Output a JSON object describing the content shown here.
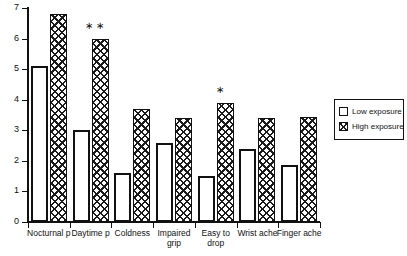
{
  "chart_data": {
    "type": "bar",
    "title": "",
    "xlabel": "",
    "ylabel": "",
    "ylim": [
      0,
      7
    ],
    "yticks": [
      0,
      1,
      2,
      3,
      4,
      5,
      6,
      7
    ],
    "grid": false,
    "legend_position": "right",
    "categories": [
      "Nocturnal p",
      "Daytime p",
      "Coldness",
      "Impaired grip",
      "Easy to drop",
      "Wrist ache",
      "Finger ache"
    ],
    "category_lines": [
      [
        "Nocturnal p"
      ],
      [
        "Daytime p"
      ],
      [
        "Coldness"
      ],
      [
        "Impaired",
        "grip"
      ],
      [
        "Easy to",
        "drop"
      ],
      [
        "Wrist ache"
      ],
      [
        "Finger ache"
      ]
    ],
    "series": [
      {
        "name": "Low exposure",
        "values": [
          5.1,
          3.0,
          1.6,
          2.6,
          1.5,
          2.4,
          1.85
        ]
      },
      {
        "name": "High exposure",
        "values": [
          6.8,
          6.0,
          3.7,
          3.4,
          3.9,
          3.4,
          3.45
        ]
      }
    ],
    "annotations": [
      {
        "category": "Daytime p",
        "marker": "∗ ∗",
        "meaning": "significance-asterisks"
      },
      {
        "category": "Easy to drop",
        "marker": "∗",
        "meaning": "significance-asterisk"
      }
    ]
  },
  "legend": {
    "items": [
      {
        "label": "Low exposure",
        "pattern": "open-white"
      },
      {
        "label": "High exposure",
        "pattern": "cross-hatch"
      }
    ]
  },
  "colors": {
    "axis": "#111111",
    "bar_low_fill": "#ffffff",
    "bar_low_stroke": "#111111",
    "bar_high_hatch": "#1a1a1a",
    "background": "#ffffff"
  }
}
